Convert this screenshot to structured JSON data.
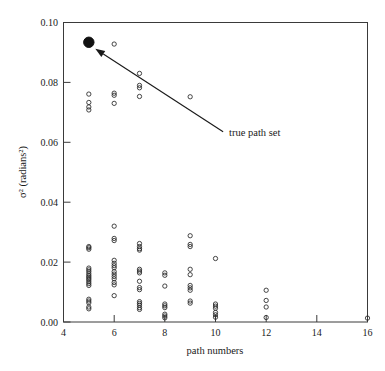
{
  "chart_data": {
    "type": "scatter",
    "title": "",
    "xlabel": "path numbers",
    "ylabel": "σ² (radians²)",
    "xlim": [
      4,
      16
    ],
    "ylim": [
      0.0,
      0.1
    ],
    "xticks": [
      4,
      6,
      8,
      10,
      12,
      14,
      16
    ],
    "xtick_labels": [
      "4",
      "6",
      "8",
      "10",
      "12",
      "14",
      "16"
    ],
    "yticks": [
      0.0,
      0.02,
      0.04,
      0.06,
      0.08,
      0.1
    ],
    "ytick_labels": [
      "0.00",
      "0.02",
      "0.04",
      "0.06",
      "0.08",
      "0.10"
    ],
    "grid": false,
    "legend": false,
    "series": [
      {
        "name": "candidate path sets",
        "marker": "open-circle",
        "color": "#262626",
        "points": [
          [
            5,
            0.0761
          ],
          [
            5,
            0.0733
          ],
          [
            5,
            0.0718
          ],
          [
            5,
            0.0708
          ],
          [
            5,
            0.0252
          ],
          [
            5,
            0.0248
          ],
          [
            5,
            0.0243
          ],
          [
            5,
            0.018
          ],
          [
            5,
            0.0174
          ],
          [
            5,
            0.0168
          ],
          [
            5,
            0.0161
          ],
          [
            5,
            0.0155
          ],
          [
            5,
            0.015
          ],
          [
            5,
            0.0145
          ],
          [
            5,
            0.014
          ],
          [
            5,
            0.0134
          ],
          [
            5,
            0.0128
          ],
          [
            5,
            0.0122
          ],
          [
            5,
            0.0076
          ],
          [
            5,
            0.007
          ],
          [
            5,
            0.0064
          ],
          [
            5,
            0.005
          ],
          [
            5,
            0.0044
          ],
          [
            6,
            0.0928
          ],
          [
            6,
            0.0764
          ],
          [
            6,
            0.0757
          ],
          [
            6,
            0.073
          ],
          [
            6,
            0.032
          ],
          [
            6,
            0.0279
          ],
          [
            6,
            0.0272
          ],
          [
            6,
            0.0206
          ],
          [
            6,
            0.0196
          ],
          [
            6,
            0.0188
          ],
          [
            6,
            0.0181
          ],
          [
            6,
            0.0168
          ],
          [
            6,
            0.016
          ],
          [
            6,
            0.0152
          ],
          [
            6,
            0.0144
          ],
          [
            6,
            0.0132
          ],
          [
            6,
            0.0124
          ],
          [
            6,
            0.0088
          ],
          [
            7,
            0.083
          ],
          [
            7,
            0.079
          ],
          [
            7,
            0.0782
          ],
          [
            7,
            0.0753
          ],
          [
            7,
            0.0262
          ],
          [
            7,
            0.0252
          ],
          [
            7,
            0.0245
          ],
          [
            7,
            0.024
          ],
          [
            7,
            0.0176
          ],
          [
            7,
            0.017
          ],
          [
            7,
            0.0164
          ],
          [
            7,
            0.0136
          ],
          [
            7,
            0.0115
          ],
          [
            7,
            0.0108
          ],
          [
            7,
            0.0068
          ],
          [
            7,
            0.0062
          ],
          [
            7,
            0.0056
          ],
          [
            7,
            0.0048
          ],
          [
            7,
            0.0042
          ],
          [
            8,
            0.0164
          ],
          [
            8,
            0.0156
          ],
          [
            8,
            0.012
          ],
          [
            8,
            0.006
          ],
          [
            8,
            0.0054
          ],
          [
            8,
            0.0048
          ],
          [
            8,
            0.0026
          ],
          [
            8,
            0.002
          ],
          [
            8,
            0.0014
          ],
          [
            9,
            0.0752
          ],
          [
            9,
            0.0288
          ],
          [
            9,
            0.0259
          ],
          [
            9,
            0.0252
          ],
          [
            9,
            0.0176
          ],
          [
            9,
            0.0122
          ],
          [
            9,
            0.0114
          ],
          [
            9,
            0.0106
          ],
          [
            9,
            0.007
          ],
          [
            9,
            0.0063
          ],
          [
            9,
            0.0158
          ],
          [
            10,
            0.0212
          ],
          [
            10,
            0.006
          ],
          [
            10,
            0.0053
          ],
          [
            10,
            0.0046
          ],
          [
            10,
            0.0032
          ],
          [
            10,
            0.0024
          ],
          [
            10,
            0.0016
          ],
          [
            12,
            0.0106
          ],
          [
            12,
            0.0072
          ],
          [
            12,
            0.005
          ],
          [
            12,
            0.0015
          ],
          [
            16,
            0.0013
          ]
        ]
      },
      {
        "name": "true path set",
        "marker": "filled-circle",
        "color": "#111111",
        "points": [
          [
            5,
            0.0934
          ]
        ]
      }
    ],
    "annotations": [
      {
        "text": "true path set",
        "target_point": [
          5,
          0.0934
        ],
        "text_x": 10.3,
        "text_y": 0.0635
      }
    ]
  }
}
